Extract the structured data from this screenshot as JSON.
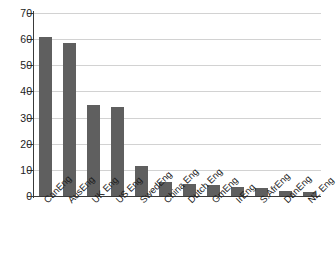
{
  "chart_data": {
    "type": "bar",
    "title": "",
    "subtitle": "",
    "xlabel": "",
    "ylabel": "",
    "ylim": [
      0,
      70
    ],
    "ytick_step": 10,
    "yticks": [
      0,
      10,
      20,
      30,
      40,
      50,
      60,
      70
    ],
    "ytick_labels": [
      "0",
      "10",
      "20",
      "30",
      "40",
      "50",
      "60",
      "70"
    ],
    "grid": true,
    "grid_axis": "y",
    "legend": false,
    "legend_position": "none",
    "orientation": "vertical",
    "bar_color": "#5f5f5f",
    "gridline_color": "#d2d2d2",
    "axis_color": "#3a3a3a",
    "background_color": "#ffffff",
    "label_rotation": -45,
    "categories": [
      "CanEng",
      "AusEng",
      "UK Eng",
      "US Eng",
      "SwedEng",
      "China Eng",
      "Dutch Eng",
      "GmEng",
      "IrEng",
      "S.AfrEng",
      "DanEng",
      "NZ Eng"
    ],
    "values": [
      61,
      58.5,
      35,
      34,
      11.5,
      5.5,
      4.5,
      4.3,
      3.3,
      3,
      1.8,
      1.5
    ]
  }
}
